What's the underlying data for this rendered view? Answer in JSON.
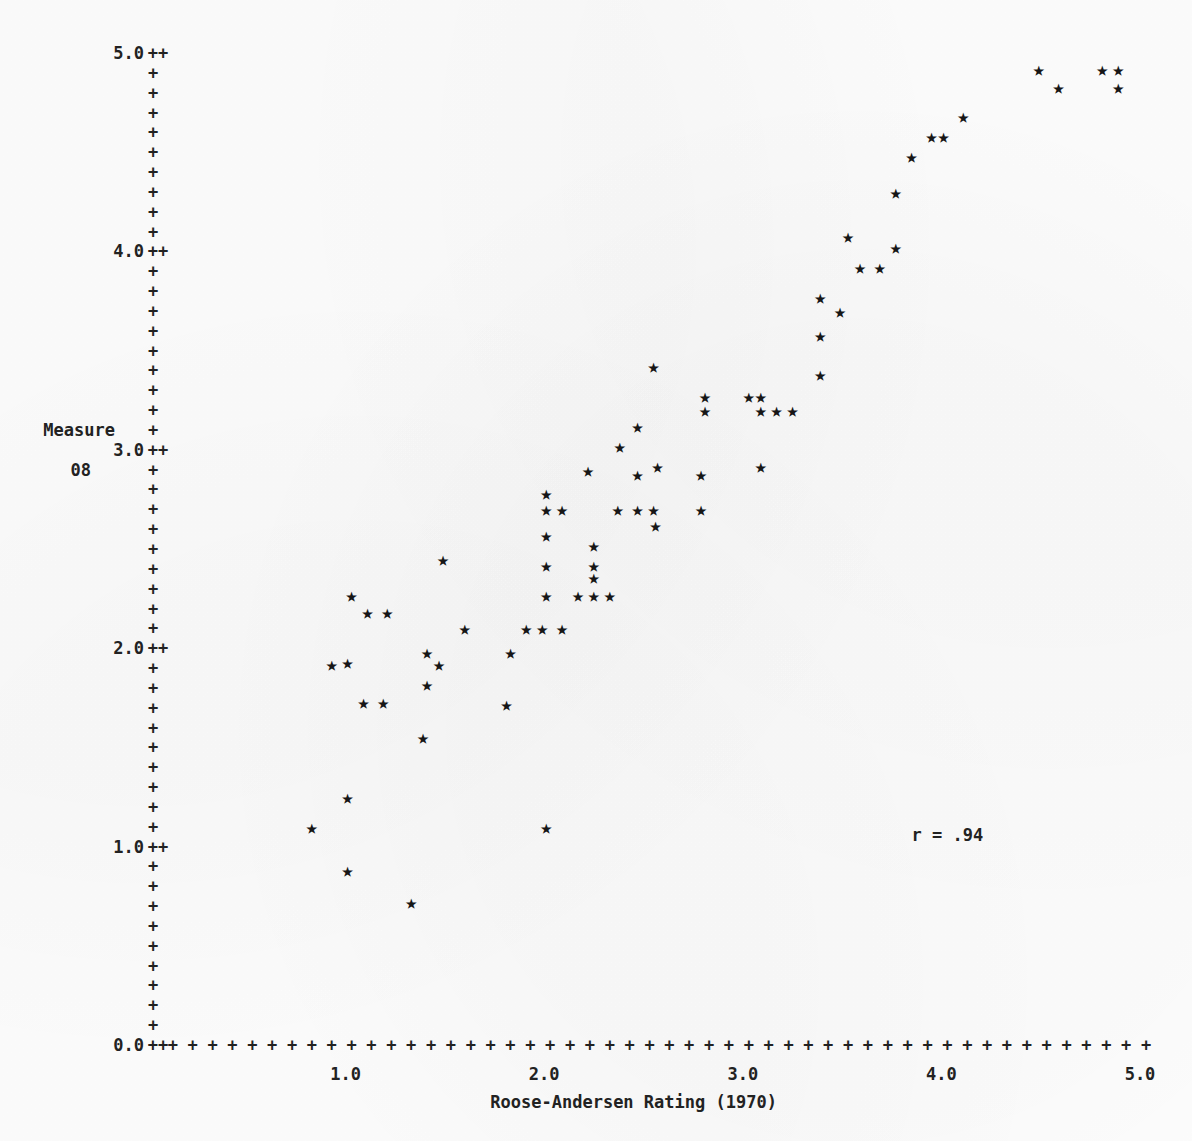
{
  "chart_data": {
    "type": "scatter",
    "title": "",
    "xlabel": "Roose-Andersen Rating (1970)",
    "ylabel": "Measure",
    "ylabel_line2": "08",
    "xlim": [
      0.0,
      5.0
    ],
    "ylim": [
      0.0,
      5.0
    ],
    "grid": false,
    "legend": null,
    "marker": "star",
    "annotations": [
      {
        "text": "r = .94",
        "x": 4.0,
        "y": 1.06
      }
    ],
    "xticklabels": [
      "0.0",
      "1.0",
      "2.0",
      "3.0",
      "4.0",
      "5.0"
    ],
    "xtickvalues": [
      0.0,
      1.0,
      2.0,
      3.0,
      4.0,
      5.0
    ],
    "yticklabels": [
      "0.0",
      "1.0",
      "2.0",
      "3.0",
      "4.0",
      "5.0"
    ],
    "ytickvalues": [
      0.0,
      1.0,
      2.0,
      3.0,
      4.0,
      5.0
    ],
    "minor_ticks_per_major": 10,
    "axis_tick_glyph": "+",
    "major_tick_glyph": "++",
    "points": [
      {
        "x": 0.8,
        "y": 1.1
      },
      {
        "x": 0.98,
        "y": 1.25
      },
      {
        "x": 0.98,
        "y": 0.88
      },
      {
        "x": 1.0,
        "y": 2.27
      },
      {
        "x": 0.9,
        "y": 1.92
      },
      {
        "x": 0.98,
        "y": 1.93
      },
      {
        "x": 1.08,
        "y": 2.18
      },
      {
        "x": 1.18,
        "y": 2.18
      },
      {
        "x": 1.06,
        "y": 1.73
      },
      {
        "x": 1.16,
        "y": 1.73
      },
      {
        "x": 1.3,
        "y": 0.72
      },
      {
        "x": 1.36,
        "y": 1.55
      },
      {
        "x": 1.38,
        "y": 1.82
      },
      {
        "x": 1.38,
        "y": 1.98
      },
      {
        "x": 1.44,
        "y": 1.92
      },
      {
        "x": 1.46,
        "y": 2.45
      },
      {
        "x": 1.57,
        "y": 2.1
      },
      {
        "x": 1.78,
        "y": 1.72
      },
      {
        "x": 1.8,
        "y": 1.98
      },
      {
        "x": 1.88,
        "y": 2.1
      },
      {
        "x": 1.96,
        "y": 2.1
      },
      {
        "x": 1.98,
        "y": 1.1
      },
      {
        "x": 1.98,
        "y": 2.27
      },
      {
        "x": 1.98,
        "y": 2.42
      },
      {
        "x": 1.98,
        "y": 2.57
      },
      {
        "x": 1.98,
        "y": 2.7
      },
      {
        "x": 1.98,
        "y": 2.78
      },
      {
        "x": 2.06,
        "y": 2.7
      },
      {
        "x": 2.06,
        "y": 2.1
      },
      {
        "x": 2.14,
        "y": 2.27
      },
      {
        "x": 2.22,
        "y": 2.27
      },
      {
        "x": 2.22,
        "y": 2.42
      },
      {
        "x": 2.22,
        "y": 2.36
      },
      {
        "x": 2.22,
        "y": 2.52
      },
      {
        "x": 2.19,
        "y": 2.9
      },
      {
        "x": 2.3,
        "y": 2.27
      },
      {
        "x": 2.34,
        "y": 2.7
      },
      {
        "x": 2.35,
        "y": 3.02
      },
      {
        "x": 2.44,
        "y": 3.12
      },
      {
        "x": 2.44,
        "y": 2.88
      },
      {
        "x": 2.44,
        "y": 2.7
      },
      {
        "x": 2.52,
        "y": 2.7
      },
      {
        "x": 2.52,
        "y": 3.42
      },
      {
        "x": 2.53,
        "y": 2.62
      },
      {
        "x": 2.54,
        "y": 2.92
      },
      {
        "x": 2.76,
        "y": 2.7
      },
      {
        "x": 2.76,
        "y": 2.88
      },
      {
        "x": 2.78,
        "y": 3.27
      },
      {
        "x": 2.78,
        "y": 3.2
      },
      {
        "x": 3.0,
        "y": 3.27
      },
      {
        "x": 3.06,
        "y": 3.27
      },
      {
        "x": 3.06,
        "y": 3.2
      },
      {
        "x": 3.14,
        "y": 3.2
      },
      {
        "x": 3.06,
        "y": 2.92
      },
      {
        "x": 3.22,
        "y": 3.2
      },
      {
        "x": 3.36,
        "y": 3.38
      },
      {
        "x": 3.36,
        "y": 3.58
      },
      {
        "x": 3.36,
        "y": 3.77
      },
      {
        "x": 3.46,
        "y": 3.7
      },
      {
        "x": 3.5,
        "y": 4.08
      },
      {
        "x": 3.56,
        "y": 3.92
      },
      {
        "x": 3.66,
        "y": 3.92
      },
      {
        "x": 3.74,
        "y": 4.02
      },
      {
        "x": 3.74,
        "y": 4.3
      },
      {
        "x": 3.82,
        "y": 4.48
      },
      {
        "x": 3.92,
        "y": 4.58
      },
      {
        "x": 3.98,
        "y": 4.58
      },
      {
        "x": 4.08,
        "y": 4.68
      },
      {
        "x": 4.46,
        "y": 4.92
      },
      {
        "x": 4.56,
        "y": 4.83
      },
      {
        "x": 4.78,
        "y": 4.92
      },
      {
        "x": 4.86,
        "y": 4.92
      },
      {
        "x": 4.86,
        "y": 4.83
      }
    ]
  },
  "layout": {
    "origin_px": {
      "x": 153,
      "y": 1045
    },
    "x_unit_px": 198.6,
    "y_unit_px": 198.4
  }
}
